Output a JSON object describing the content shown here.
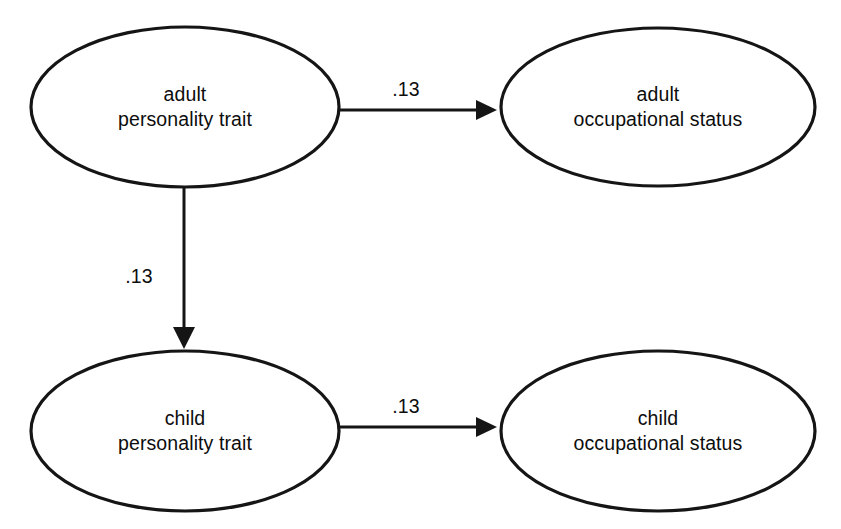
{
  "diagram": {
    "type": "path-diagram",
    "background_color": "#ffffff",
    "stroke_color": "#151515",
    "text_color": "#0d0d0d",
    "nodes": [
      {
        "id": "adult-personality-trait",
        "shape": "ellipse",
        "line1": "adult",
        "line2": "personality trait",
        "cx": 185,
        "cy": 107,
        "rx": 154,
        "ry": 80
      },
      {
        "id": "adult-occupational-status",
        "shape": "ellipse",
        "line1": "adult",
        "line2": "occupational status",
        "cx": 658,
        "cy": 107,
        "rx": 157,
        "ry": 79
      },
      {
        "id": "child-personality-trait",
        "shape": "ellipse",
        "line1": "child",
        "line2": "personality trait",
        "cx": 185,
        "cy": 431,
        "rx": 154,
        "ry": 80
      },
      {
        "id": "child-occupational-status",
        "shape": "ellipse",
        "line1": "child",
        "line2": "occupational status",
        "cx": 658,
        "cy": 431,
        "rx": 157,
        "ry": 80
      }
    ],
    "edges": [
      {
        "id": "adult-trait-to-adult-status",
        "from": "adult-personality-trait",
        "to": "adult-occupational-status",
        "label": ".13",
        "orientation": "horizontal",
        "label_x": 406,
        "label_y": 89
      },
      {
        "id": "adult-trait-to-child-trait",
        "from": "adult-personality-trait",
        "to": "child-personality-trait",
        "label": ".13",
        "orientation": "vertical",
        "label_x": 139,
        "label_y": 276
      },
      {
        "id": "child-trait-to-child-status",
        "from": "child-personality-trait",
        "to": "child-occupational-status",
        "label": ".13",
        "orientation": "horizontal",
        "label_x": 406,
        "label_y": 406
      }
    ]
  }
}
